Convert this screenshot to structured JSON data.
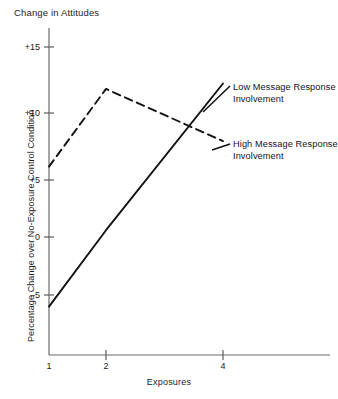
{
  "chart_data": {
    "type": "line",
    "title": "Change in Attitudes",
    "xlabel": "Exposures",
    "ylabel": "Percentage Change over No-Exposure Control Condition",
    "x": [
      1,
      2,
      4
    ],
    "xlim": [
      1,
      4.35
    ],
    "ylim": [
      -8,
      17
    ],
    "xticks": [
      1,
      2,
      4
    ],
    "xtick_labels": [
      "1",
      "2",
      "4"
    ],
    "yticks": [
      -5,
      0,
      5,
      10,
      15
    ],
    "ytick_labels": [
      "–5",
      "0",
      "+5",
      "+10",
      "+15"
    ],
    "grid": false,
    "legend_position": "inline-right-annotations",
    "series": [
      {
        "name": "Low Message Response Involvement",
        "style": "solid",
        "color": "#111111",
        "values": [
          -6.0,
          0.6,
          12.2
        ]
      },
      {
        "name": "High Message Response Involvement",
        "style": "dashed",
        "color": "#111111",
        "values": [
          6.0,
          11.8,
          7.9
        ]
      }
    ],
    "annotations": [
      {
        "id": "low-involvement-label",
        "lines": [
          "Low Message Response",
          "Involvement"
        ]
      },
      {
        "id": "high-involvement-label",
        "lines": [
          "High Message Response",
          "Involvement"
        ]
      }
    ]
  }
}
